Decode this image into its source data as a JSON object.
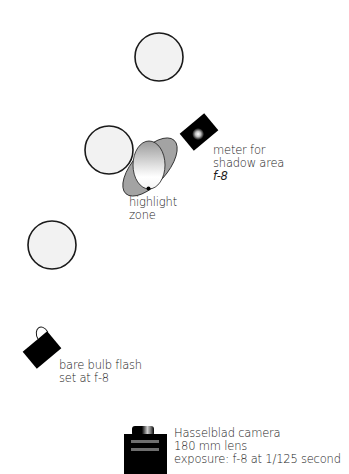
{
  "diagram": {
    "colors": {
      "background": "#ffffff",
      "circle_fill": "#f2f2f2",
      "outline": "#1a1a1a",
      "reflector_fill": "#a3a3a3",
      "equipment": "#000000"
    },
    "elements": {
      "lights": [
        {
          "id": "light-top",
          "cx": 159,
          "cy": 57,
          "r": 24
        },
        {
          "id": "light-middle",
          "cx": 109,
          "cy": 150,
          "r": 24
        },
        {
          "id": "light-lower",
          "cx": 52,
          "cy": 245,
          "r": 24
        }
      ]
    },
    "labels": {
      "meter": [
        "meter for",
        "shadow area",
        "f-8"
      ],
      "highlight": [
        "highlight",
        "zone"
      ],
      "flash": [
        "bare bulb flash",
        "set at f-8"
      ],
      "camera": [
        "Hasselblad camera",
        "180 mm lens",
        "exposure: f-8 at 1/125 second"
      ]
    }
  }
}
